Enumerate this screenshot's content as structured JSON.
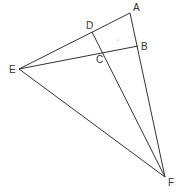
{
  "diagram": {
    "type": "geometry",
    "points": {
      "A": {
        "label": "A",
        "x": 130,
        "y": 13,
        "lx": 133,
        "ly": 11
      },
      "B": {
        "label": "B",
        "x": 138,
        "y": 46,
        "lx": 141,
        "ly": 50
      },
      "C": {
        "label": "C",
        "x": 102,
        "y": 52,
        "lx": 96,
        "ly": 63
      },
      "D": {
        "label": "D",
        "x": 92,
        "y": 32,
        "lx": 86,
        "ly": 29
      },
      "E": {
        "label": "E",
        "x": 19,
        "y": 69,
        "lx": 9,
        "ly": 73
      },
      "F": {
        "label": "F",
        "x": 165,
        "y": 177,
        "lx": 168,
        "ly": 186
      }
    },
    "segments": [
      {
        "from": "E",
        "to": "A"
      },
      {
        "from": "E",
        "to": "B"
      },
      {
        "from": "E",
        "to": "F"
      },
      {
        "from": "A",
        "to": "F"
      },
      {
        "from": "D",
        "to": "F"
      }
    ],
    "stray_dot": {
      "x": 118,
      "y": 40
    }
  }
}
